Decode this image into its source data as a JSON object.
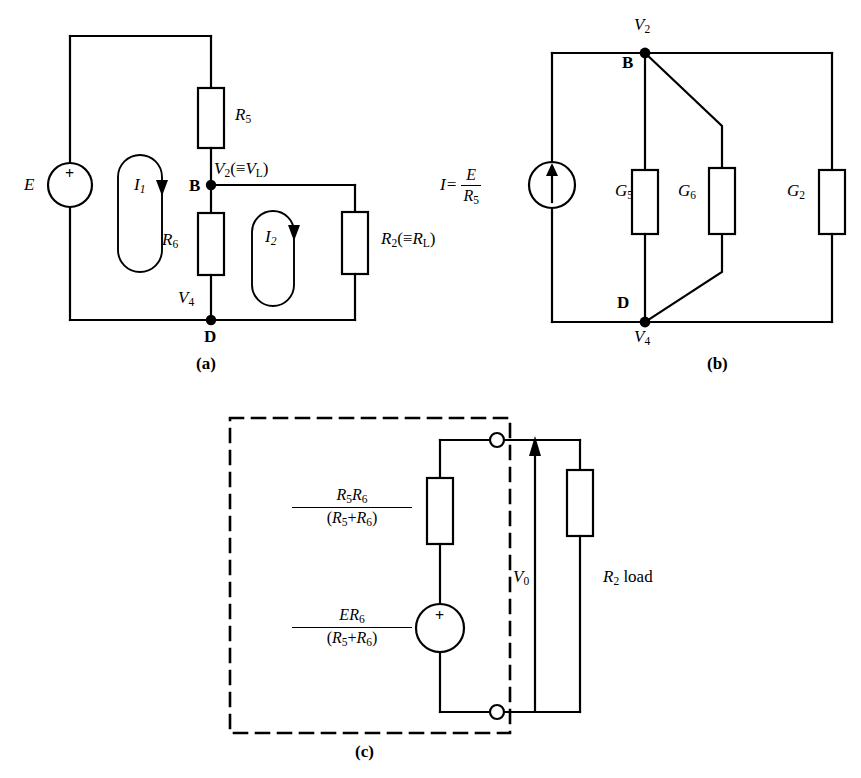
{
  "figure": {
    "type": "circuit-diagram",
    "panels": [
      {
        "id": "a",
        "caption": "(a)",
        "description": "Two-mesh resistive network with voltage source E",
        "source": {
          "name": "E",
          "symbol": "+",
          "kind": "voltage-source"
        },
        "components": [
          {
            "name": "R5",
            "base": "R",
            "sub": "5"
          },
          {
            "name": "R6",
            "base": "R",
            "sub": "6"
          },
          {
            "name": "R2",
            "base": "R",
            "sub": "2",
            "equiv": "R",
            "equiv_sub": "L"
          }
        ],
        "nodes": [
          {
            "name": "B",
            "voltage_base": "V",
            "voltage_sub": "2",
            "equiv": "V",
            "equiv_sub": "L"
          },
          {
            "name": "D",
            "voltage_base": "V",
            "voltage_sub": "4"
          }
        ],
        "mesh_currents": [
          {
            "base": "I",
            "sub": "1"
          },
          {
            "base": "I",
            "sub": "2"
          }
        ]
      },
      {
        "id": "b",
        "caption": "(b)",
        "description": "Norton equivalent with conductances",
        "source": {
          "label_lhs": "I=",
          "num": "E",
          "num_sub": "",
          "den": "R",
          "den_sub": "5",
          "kind": "current-source"
        },
        "components": [
          {
            "name": "G5",
            "base": "G",
            "sub": "5"
          },
          {
            "name": "G6",
            "base": "G",
            "sub": "6"
          },
          {
            "name": "G2",
            "base": "G",
            "sub": "2"
          }
        ],
        "nodes": [
          {
            "name": "B",
            "voltage_base": "V",
            "voltage_sub": "2"
          },
          {
            "name": "D",
            "voltage_base": "V",
            "voltage_sub": "4"
          }
        ]
      },
      {
        "id": "c",
        "caption": "(c)",
        "description": "Thevenin equivalent driving load resistor",
        "thevenin_resistance": {
          "num": "R₅R₆",
          "num_parts": [
            {
              "base": "R",
              "sub": "5"
            },
            {
              "base": "R",
              "sub": "6"
            }
          ],
          "den_parts": [
            {
              "base": "R",
              "sub": "5"
            },
            {
              "op": "+"
            },
            {
              "base": "R",
              "sub": "6"
            }
          ]
        },
        "thevenin_source": {
          "num_parts": [
            {
              "base": "E"
            },
            {
              "base": "R",
              "sub": "6"
            }
          ],
          "den_parts": [
            {
              "base": "R",
              "sub": "5"
            },
            {
              "op": "+"
            },
            {
              "base": "R",
              "sub": "6"
            }
          ],
          "symbol": "+"
        },
        "output_voltage": {
          "base": "V",
          "sub": "0"
        },
        "load": {
          "base": "R",
          "sub": "2",
          "suffix": " load"
        },
        "boundary": "dashed-box",
        "terminals": 2
      }
    ]
  },
  "labels": {
    "a": {
      "source_E": "E",
      "source_plus": "+",
      "R5": "R",
      "R5_sub": "5",
      "R6": "R",
      "R6_sub": "6",
      "R2": "R",
      "R2_sub": "2",
      "R2_equiv_open": "(≡",
      "R2_equiv": "R",
      "R2_equiv_sub": "L",
      "R2_equiv_close": ")",
      "V2": "V",
      "V2_sub": "2",
      "V2_equiv_open": "(≡",
      "V2_equiv": "V",
      "V2_equiv_sub": "L",
      "V2_equiv_close": ")",
      "V4": "V",
      "V4_sub": "4",
      "node_B": "B",
      "node_D": "D",
      "I1": "I",
      "I1_sub": "1",
      "I2": "I",
      "I2_sub": "2",
      "caption": "(a)"
    },
    "b": {
      "source_lhs": "I=",
      "source_num": "E",
      "source_den": "R",
      "source_den_sub": "5",
      "G5": "G",
      "G5_sub": "5",
      "G6": "G",
      "G6_sub": "6",
      "G2": "G",
      "G2_sub": "2",
      "V2": "V",
      "V2_sub": "2",
      "V4": "V",
      "V4_sub": "4",
      "node_B": "B",
      "node_D": "D",
      "caption": "(b)"
    },
    "c": {
      "rth_num_a": "R",
      "rth_num_a_sub": "5",
      "rth_num_b": "R",
      "rth_num_b_sub": "6",
      "rth_den_open": "(",
      "rth_den_a": "R",
      "rth_den_a_sub": "5",
      "rth_den_op": "+",
      "rth_den_b": "R",
      "rth_den_b_sub": "6",
      "rth_den_close": ")",
      "eth_num_a": "E",
      "eth_num_b": "R",
      "eth_num_b_sub": "6",
      "eth_den_open": "(",
      "eth_den_a": "R",
      "eth_den_a_sub": "5",
      "eth_den_op": "+",
      "eth_den_b": "R",
      "eth_den_b_sub": "6",
      "eth_den_close": ")",
      "source_plus": "+",
      "V0": "V",
      "V0_sub": "0",
      "load_R": "R",
      "load_sub": "2",
      "load_text": " load",
      "caption": "(c)"
    }
  },
  "colors": {
    "line": "#000000",
    "background": "#ffffff"
  }
}
